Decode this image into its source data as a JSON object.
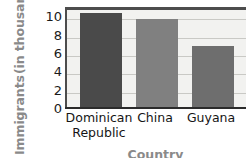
{
  "chart_data": {
    "type": "bar",
    "title": "",
    "categories": [
      "Dominican Republic",
      "China",
      "Guyana"
    ],
    "values": [
      10.4,
      9.7,
      6.8
    ],
    "series": [
      {
        "name": "Immigrants",
        "values": [
          10.4,
          9.7,
          6.8
        ]
      }
    ],
    "xlabel": "Country",
    "ylabel": "Immigrants (in thousands)",
    "ylim": [
      0,
      11
    ],
    "yticks": [
      0,
      2,
      4,
      6,
      8,
      10
    ],
    "ytick_labels": [
      "0",
      "2",
      "4",
      "6",
      "8",
      "10"
    ],
    "grid": true,
    "grid_orientation": "horizontal",
    "legend": false,
    "bar_colors": [
      "#4a4a4a",
      "#808080",
      "#6e6e6e"
    ],
    "plot_background": "#f2f2f0",
    "axis_color": "#2b2b2b",
    "gridline_color": "#c9c9c5",
    "axis_title_color": "#8a8a8a",
    "cropped_right_edge": true
  },
  "axes": {
    "y_title_lines": [
      "Immigrants",
      "(in thousands)"
    ],
    "x_title": "Country"
  },
  "categories_display": [
    {
      "lines": [
        "Dominican",
        "Republic"
      ]
    },
    {
      "lines": [
        "China"
      ]
    },
    {
      "lines": [
        "Guyana"
      ]
    }
  ]
}
